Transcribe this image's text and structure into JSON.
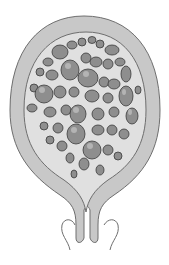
{
  "illustration": {
    "subject": "uterus-with-grape-like-vesicle-clusters",
    "colors": {
      "background": "#ffffff",
      "wall_fill": "#c8c8c8",
      "wall_outline": "#6e6e6e",
      "cavity_fill": "#e0e0e0",
      "vesicle_fill": "#8e8e8e",
      "vesicle_highlight": "#b4b4b4",
      "vesicle_outline": "#3a3a3a"
    }
  }
}
